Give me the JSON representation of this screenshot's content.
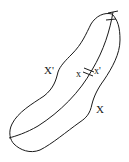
{
  "diagram": {
    "labels": {
      "outer_left": "X'",
      "point_x": "x",
      "point_x_prime": "x'",
      "outer_right": "X"
    },
    "stroke_color": "#1a1a1a",
    "background": "#ffffff"
  }
}
